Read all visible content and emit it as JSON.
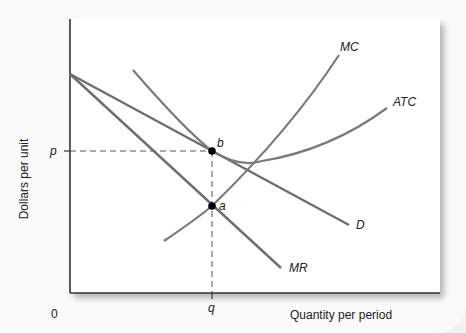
{
  "diagram": {
    "type": "monopolistic-competition-short-run-equilibrium",
    "axes": {
      "ylabel": "Dollars per unit",
      "xlabel": "Quantity per period",
      "origin_label": "0"
    },
    "curves": [
      {
        "name": "MC",
        "label": "MC"
      },
      {
        "name": "ATC",
        "label": "ATC"
      },
      {
        "name": "D",
        "label": "D"
      },
      {
        "name": "MR",
        "label": "MR"
      }
    ],
    "points": [
      {
        "name": "b",
        "label": "b"
      },
      {
        "name": "a",
        "label": "a"
      }
    ],
    "ticks": {
      "price": "p",
      "quantity": "q"
    },
    "colors": {
      "curve": "#6e6e6e",
      "axis": "#333333",
      "point": "#000000",
      "panel": "#ffffff",
      "background": "#fafafa"
    }
  }
}
